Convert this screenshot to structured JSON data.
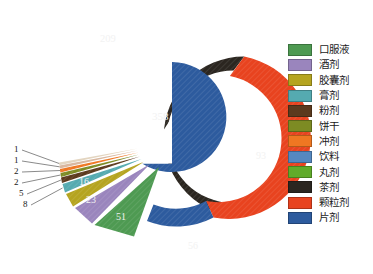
{
  "chart_data": {
    "type": "pie",
    "title": "",
    "subtitle": "",
    "xlabel": "",
    "ylabel": "",
    "legend_position": "right",
    "grid": false,
    "categories": [
      "口服液",
      "酒剂",
      "胶囊剂",
      "膏剂",
      "粉剂",
      "饼干",
      "冲剂",
      "饮料",
      "丸剂",
      "茶剂",
      "颗粒剂",
      "片剂"
    ],
    "colors": [
      "#4e9a52",
      "#9a85bd",
      "#b5a420",
      "#55aab0",
      "#5c3a1e",
      "#7d8b23",
      "#ef7722",
      "#5588c0",
      "#61ab2a",
      "#2b2620",
      "#e8431f",
      "#2d5b9e"
    ],
    "values": [
      51,
      23,
      16,
      5,
      1,
      1,
      93,
      2,
      2,
      209,
      93,
      358
    ],
    "outer_ring": {
      "name": "outer-donut",
      "segments": [
        {
          "label": "茶剂",
          "value": 209,
          "color": "#2b2620"
        },
        {
          "label": "颗粒剂",
          "value": 93,
          "color": "#e8431f"
        },
        {
          "label": "片剂",
          "value": 56,
          "color": "#2d5b9e"
        }
      ]
    },
    "inner_pie": {
      "name": "inner-pie",
      "segments": [
        {
          "label": "片剂",
          "value": 358,
          "color": "#2d5b9e"
        },
        {
          "label": "口服液",
          "value": 51,
          "color": "#4e9a52"
        },
        {
          "label": "酒剂",
          "value": 23,
          "color": "#9a85bd"
        },
        {
          "label": "胶囊剂",
          "value": 16,
          "color": "#b5a420"
        },
        {
          "label": "膏剂",
          "value": 8,
          "color": "#55aab0"
        },
        {
          "label": "粉剂",
          "value": 5,
          "color": "#5c3a1e"
        },
        {
          "label": "饼干",
          "value": 2,
          "color": "#7d8b23"
        },
        {
          "label": "饮料",
          "value": 2,
          "color": "#ef7722"
        },
        {
          "label": "丸剂",
          "value": 1,
          "color": "#d9b8a0"
        },
        {
          "label": "冲剂",
          "value": 1,
          "color": "#e3d5c0"
        }
      ]
    },
    "data_labels": {
      "center": "358",
      "ring_dark": "209",
      "ring_red": "93",
      "ring_blue": "56",
      "slice_green": "51",
      "slice_purple": "23",
      "slice_olive": "16",
      "leader_1": "1",
      "leader_2": "1",
      "leader_3": "2",
      "leader_4": "2",
      "leader_5": "5",
      "leader_6": "8"
    }
  },
  "legend": {
    "items": [
      {
        "label": "口服液",
        "color": "#4e9a52"
      },
      {
        "label": "酒剂",
        "color": "#9a85bd"
      },
      {
        "label": "胶囊剂",
        "color": "#b5a420"
      },
      {
        "label": "膏剂",
        "color": "#55aab0"
      },
      {
        "label": "粉剂",
        "color": "#5c3a1e"
      },
      {
        "label": "饼干",
        "color": "#7d8b23"
      },
      {
        "label": "冲剂",
        "color": "#ef7722"
      },
      {
        "label": "饮料",
        "color": "#5588c0"
      },
      {
        "label": "丸剂",
        "color": "#61ab2a"
      },
      {
        "label": "茶剂",
        "color": "#2b2620"
      },
      {
        "label": "颗粒剂",
        "color": "#e8431f"
      },
      {
        "label": "片剂",
        "color": "#2d5b9e"
      }
    ]
  },
  "caption": {
    "text": ""
  }
}
